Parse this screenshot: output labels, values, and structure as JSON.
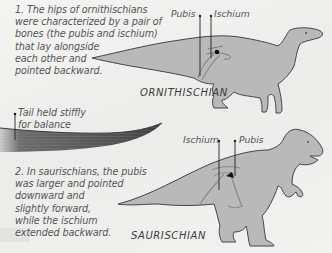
{
  "ornithischian": {
    "note": "1. The hips of ornithischians\nwere characterized by a pair of\nbones (the pubis and ischium)\nthat lay alongside\neach other and\npointed backward.",
    "caption": "ORNITHISCHIAN",
    "labels": {
      "pubis": "Pubis",
      "ischium": "Ischium"
    }
  },
  "tail": {
    "note": "Tail held stiffly\nfor balance"
  },
  "saurischian": {
    "note": "2. In saurischians, the pubis\nwas larger and pointed\ndownward and\nslightly forward,\nwhile the ischium\nextended backward.",
    "caption": "SAURISCHIAN",
    "labels": {
      "ischium": "Ischium",
      "pubis": "Pubis"
    }
  },
  "colors": {
    "background": "#efefee",
    "dino_fill": "#b9b9b9",
    "dino_outline": "#4a4a4a",
    "text": "#555555",
    "hip_dot": "#111111",
    "tail_texture": "#5a5a5a"
  }
}
